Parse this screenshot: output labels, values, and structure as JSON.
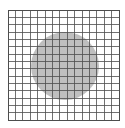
{
  "figure": {
    "title": "",
    "background_color": "#ffffff",
    "width": 125,
    "height": 128
  },
  "chart_data": {
    "type": "heatmap",
    "title": "",
    "subtitle": "",
    "xlabel": "",
    "ylabel": "",
    "grid": true,
    "legend_position": "none",
    "annotations": [],
    "plot_area": {
      "x": 8,
      "y": 10,
      "width": 111,
      "height": 110
    },
    "mesh": {
      "columns": 15,
      "rows": 15,
      "cell_width": 7.4,
      "cell_height": 7.333,
      "line_color": "#4d4d4d",
      "line_width": 0.8,
      "fill_color": "#ffffff"
    },
    "border": {
      "color": "#4d4d4d",
      "width": 1.0
    },
    "xlim": [
      0,
      15
    ],
    "ylim": [
      0,
      15
    ],
    "x_ticks": [],
    "y_ticks": [],
    "x_tick_labels": [],
    "y_tick_labels": [],
    "regions": [
      {
        "name": "circular-region",
        "shape": "circle",
        "center_x": 65,
        "center_y": 66,
        "radius": 34,
        "fill_color": "#b4b4b4",
        "fill_opacity": 0.85,
        "stroke": "none",
        "value": 1
      }
    ],
    "series": [
      {
        "name": "background-domain",
        "value": 0,
        "color": "#ffffff"
      },
      {
        "name": "circular-inclusion",
        "value": 1,
        "color": "#b4b4b4"
      }
    ]
  }
}
